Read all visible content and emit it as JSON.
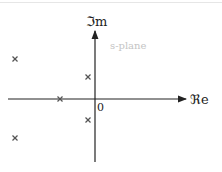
{
  "diagram": {
    "title": "s-plane",
    "axes": {
      "imag_label": "ℑm",
      "real_label": "ℜe",
      "origin_label": "0"
    },
    "poles": [
      {
        "x": 15,
        "y": 59
      },
      {
        "x": 15,
        "y": 138
      },
      {
        "x": 88,
        "y": 77
      },
      {
        "x": 88,
        "y": 120
      },
      {
        "x": 60,
        "y": 99
      }
    ],
    "pole_marker": "×",
    "colors": {
      "axis": "#222222",
      "pole": "#555555",
      "plane_label": "#c4c4c4"
    }
  }
}
